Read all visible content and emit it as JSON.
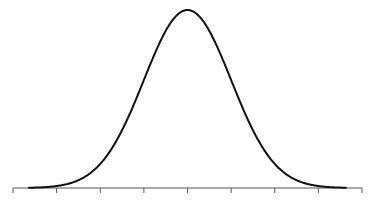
{
  "chart_data": {
    "type": "line",
    "title": "",
    "xlabel": "",
    "ylabel": "",
    "mean": 0,
    "std": 1,
    "x_ticks": [
      -4,
      -3,
      -2,
      -1,
      0,
      1,
      2,
      3,
      4
    ],
    "tick_labels": [
      "",
      "",
      "",
      "",
      "",
      "",
      "",
      "",
      ""
    ],
    "xlim": [
      -4,
      4
    ],
    "ylim": [
      0,
      0.4
    ],
    "grid": false,
    "legend": null,
    "series": [
      {
        "name": "normal-pdf",
        "color": "#111111",
        "x": [
          -3.5,
          -3,
          -2.5,
          -2,
          -1.5,
          -1,
          -0.5,
          0,
          0.5,
          1,
          1.5,
          2,
          2.5,
          3,
          3.5
        ],
        "values": [
          0.0009,
          0.0044,
          0.0175,
          0.054,
          0.1295,
          0.242,
          0.3521,
          0.3989,
          0.3521,
          0.242,
          0.1295,
          0.054,
          0.0175,
          0.0044,
          0.0009
        ]
      }
    ],
    "colors": {
      "axis": "#555555",
      "curve": "#111111",
      "background": "#ffffff"
    }
  }
}
